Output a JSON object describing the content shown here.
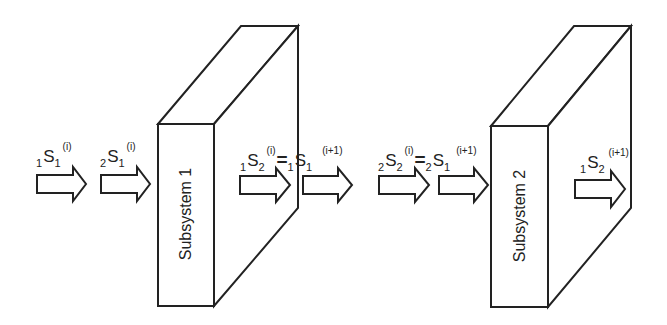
{
  "diagram": {
    "subsystems": [
      {
        "label": "Subsystem 1"
      },
      {
        "label": "Subsystem 2"
      }
    ],
    "signals": [
      {
        "pre": "1",
        "base": "S",
        "sub": "1",
        "sup": "(i)"
      },
      {
        "pre": "2",
        "base": "S",
        "sub": "1",
        "sup": "(i)"
      },
      {
        "lhs": {
          "pre": "1",
          "base": "S",
          "sub": "2",
          "sup": "(i)"
        },
        "eq": "=",
        "rhs": {
          "pre": "1",
          "base": "S",
          "sub": "1",
          "sup": "(i+1)"
        }
      },
      {
        "lhs": {
          "pre": "2",
          "base": "S",
          "sub": "2",
          "sup": "(i)"
        },
        "eq": "=",
        "rhs": {
          "pre": "2",
          "base": "S",
          "sub": "1",
          "sup": "(i+1)"
        }
      },
      {
        "pre": "1",
        "base": "S",
        "sub": "2",
        "sup": "(i+1)"
      }
    ],
    "colors": {
      "stroke": "#222222",
      "fill": "#ffffff"
    }
  }
}
